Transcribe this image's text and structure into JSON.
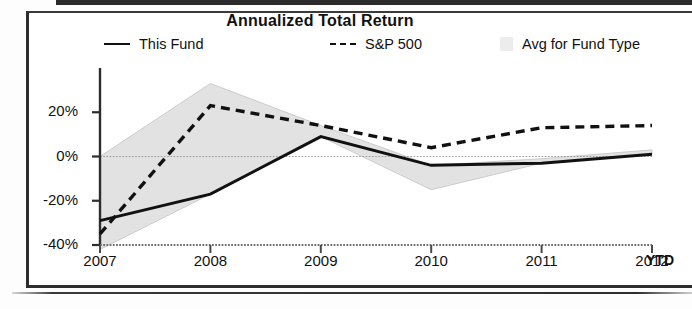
{
  "chart_data": {
    "type": "line",
    "title": "Annualized Total Return",
    "xlabel": "",
    "ylabel": "",
    "x": [
      "2007",
      "2008",
      "2009",
      "2010",
      "2011",
      "2012"
    ],
    "x_axis_note": "YTD",
    "ylim": [
      -40,
      40
    ],
    "ytick_labels": [
      "20%",
      "0%",
      "-20%",
      "-40%"
    ],
    "yticks": [
      20,
      0,
      -20,
      -40
    ],
    "grid": false,
    "zero_line": true,
    "legend_position": "top",
    "series": [
      {
        "name": "This Fund",
        "style": "solid",
        "color": "#111111",
        "values": [
          -29,
          -17,
          9,
          -4,
          -3,
          1
        ]
      },
      {
        "name": "S&P 500",
        "style": "dashed",
        "color": "#111111",
        "values": [
          -35,
          23,
          14,
          4,
          13,
          14
        ]
      },
      {
        "name": "Avg for Fund Type",
        "style": "band",
        "color": "#e2e2e2",
        "upper": [
          0,
          33,
          14,
          -4,
          -1,
          3
        ],
        "lower": [
          -42,
          -17,
          9,
          -15,
          -3,
          1
        ]
      }
    ]
  },
  "legend": {
    "fund_label": "This Fund",
    "sp_label": "S&P 500",
    "avg_label": "Avg for Fund Type"
  }
}
